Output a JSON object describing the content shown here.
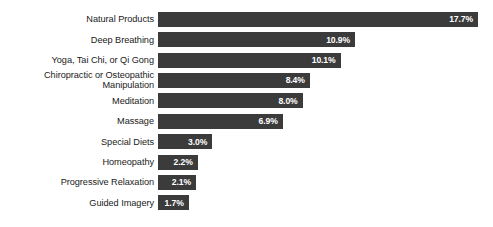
{
  "chart_data": {
    "type": "bar",
    "orientation": "horizontal",
    "title": "",
    "subtitle": "",
    "xlabel": "",
    "ylabel": "",
    "xlim": [
      0,
      17.7
    ],
    "grid": false,
    "legend": false,
    "value_suffix": "%",
    "bar_color": "#3b3b3b",
    "value_label_color": "#ffffff",
    "background_color": "#ffffff",
    "categories": [
      "Natural Products",
      "Deep Breathing",
      "Yoga, Tai Chi, or Qi Gong",
      "Chiropractic or Osteopathic\nManipulation",
      "Meditation",
      "Massage",
      "Special Diets",
      "Homeopathy",
      "Progressive Relaxation",
      "Guided Imagery"
    ],
    "values": [
      17.7,
      10.9,
      10.1,
      8.4,
      8.0,
      6.9,
      3.0,
      2.2,
      2.1,
      1.7
    ],
    "value_labels": [
      "17.7%",
      "10.9%",
      "10.1%",
      "8.4%",
      "8.0%",
      "6.9%",
      "3.0%",
      "2.2%",
      "2.1%",
      "1.7%"
    ],
    "footnote_markers": [
      "a",
      "",
      "",
      "",
      "",
      "",
      "",
      "",
      "",
      ""
    ],
    "bars": [
      {
        "category": "Natural Products",
        "footnote": "a",
        "value": 17.7,
        "label": "17.7%"
      },
      {
        "category": "Deep Breathing",
        "footnote": "",
        "value": 10.9,
        "label": "10.9%"
      },
      {
        "category": "Yoga, Tai Chi, or Qi Gong",
        "footnote": "",
        "value": 10.1,
        "label": "10.1%"
      },
      {
        "category": "Chiropractic or Osteopathic\nManipulation",
        "footnote": "",
        "value": 8.4,
        "label": "8.4%"
      },
      {
        "category": "Meditation",
        "footnote": "",
        "value": 8.0,
        "label": "8.0%"
      },
      {
        "category": "Massage",
        "footnote": "",
        "value": 6.9,
        "label": "6.9%"
      },
      {
        "category": "Special Diets",
        "footnote": "",
        "value": 3.0,
        "label": "3.0%"
      },
      {
        "category": "Homeopathy",
        "footnote": "",
        "value": 2.2,
        "label": "2.2%"
      },
      {
        "category": "Progressive Relaxation",
        "footnote": "",
        "value": 2.1,
        "label": "2.1%"
      },
      {
        "category": "Guided Imagery",
        "footnote": "",
        "value": 1.7,
        "label": "1.7%"
      }
    ]
  }
}
